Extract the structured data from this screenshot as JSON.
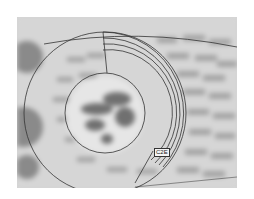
{
  "figure": {
    "label": "C2E",
    "colors": {
      "background": "#d4d4d4",
      "line": "#333333",
      "brick": "#9a9a9a",
      "mortar": "#e2e2e2",
      "blob": "#6e6e6e"
    }
  }
}
